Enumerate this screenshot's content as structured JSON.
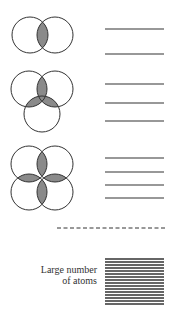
{
  "figure": {
    "colors": {
      "stroke": "#333333",
      "overlap_fill": "#8a8a8a",
      "background": "#ffffff"
    },
    "rows": [
      {
        "id": "two-atoms",
        "atoms": 2,
        "circles": [
          [
            30,
            35
          ],
          [
            55,
            35
          ]
        ],
        "radius": 18,
        "levels_y": [
          29,
          54
        ]
      },
      {
        "id": "three-atoms",
        "atoms": 3,
        "circles": [
          [
            29,
            89
          ],
          [
            55,
            89
          ],
          [
            42,
            114
          ]
        ],
        "radius": 18,
        "levels_y": [
          84,
          103,
          121
        ]
      },
      {
        "id": "four-atoms",
        "atoms": 4,
        "circles": [
          [
            29,
            164
          ],
          [
            55,
            164
          ],
          [
            29,
            192
          ],
          [
            55,
            192
          ]
        ],
        "radius": 18,
        "levels_y": [
          158,
          172,
          185,
          198
        ]
      }
    ],
    "levels_x": [
      105,
      164
    ],
    "separator": {
      "style": "dashed",
      "y": 228,
      "x": [
        57,
        165
      ]
    },
    "band": {
      "label_line1": "Large number",
      "label_line2": "of atoms",
      "y_start": 259,
      "y_end": 304,
      "line_count": 16,
      "x": [
        105,
        164
      ]
    }
  }
}
